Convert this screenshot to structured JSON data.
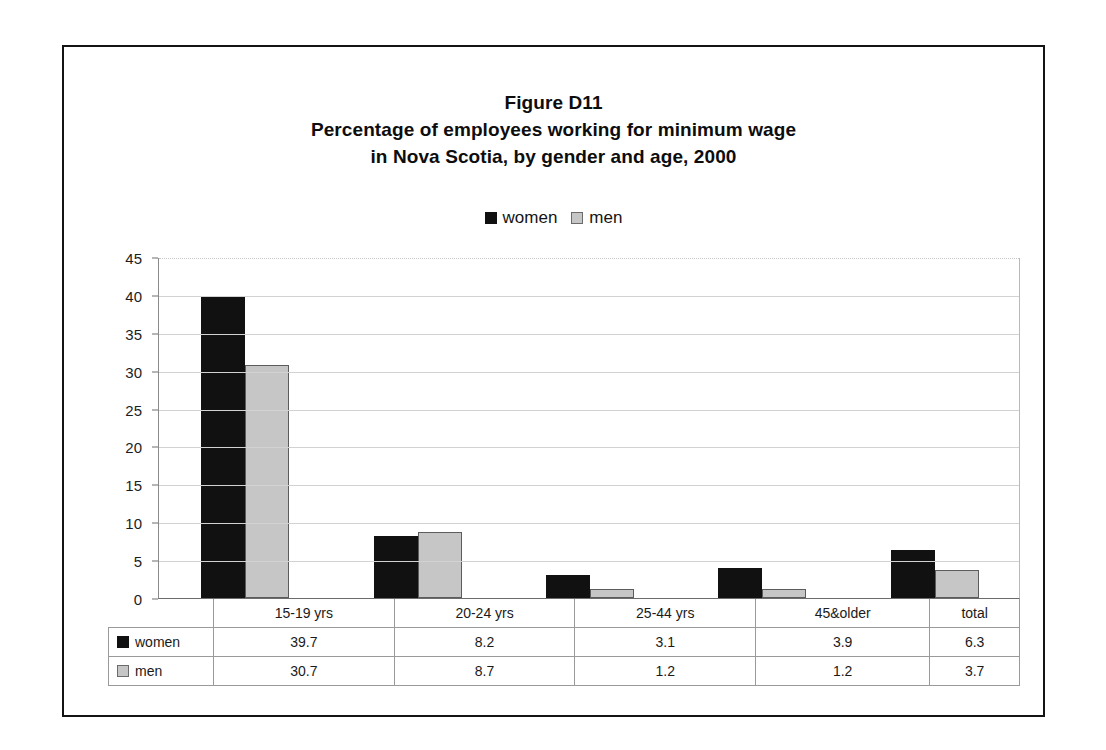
{
  "figure": {
    "title_lines": [
      "Figure D11",
      "Percentage of employees working for minimum wage",
      "in Nova Scotia, by gender and age, 2000"
    ]
  },
  "legend": {
    "items": [
      {
        "label": "women",
        "swatch": "black-square-icon",
        "color": "#101010"
      },
      {
        "label": "men",
        "swatch": "gray-square-icon",
        "color": "#c6c6c6"
      }
    ]
  },
  "axis": {
    "y_ticks": [
      "45",
      "40",
      "35",
      "30",
      "25",
      "20",
      "15",
      "10",
      "5",
      "0"
    ]
  },
  "table": {
    "corner": "",
    "headers": [
      "15-19 yrs",
      "20-24 yrs",
      "25-44 yrs",
      "45&older",
      "total"
    ],
    "rows": [
      {
        "label": "women",
        "values": [
          "39.7",
          "8.2",
          "3.1",
          "3.9",
          "6.3"
        ]
      },
      {
        "label": "men",
        "values": [
          "30.7",
          "8.7",
          "1.2",
          "1.2",
          "3.7"
        ]
      }
    ]
  },
  "chart_data": {
    "type": "bar",
    "xlabel": "",
    "ylabel": "",
    "ylim": [
      0,
      45
    ],
    "ytick_step": 5,
    "grid": true,
    "legend_position": "top-center",
    "categories": [
      "15-19 yrs",
      "20-24 yrs",
      "25-44 yrs",
      "45&older",
      "total"
    ],
    "series": [
      {
        "name": "women",
        "color": "#101010",
        "values": [
          39.7,
          8.2,
          3.1,
          3.9,
          6.3
        ]
      },
      {
        "name": "men",
        "color": "#c6c6c6",
        "values": [
          30.7,
          8.7,
          1.2,
          1.2,
          3.7
        ]
      }
    ]
  }
}
